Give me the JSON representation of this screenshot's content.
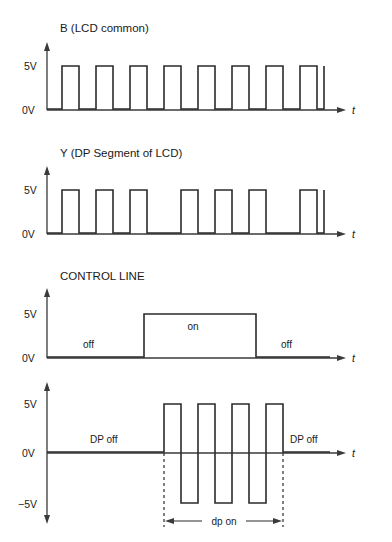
{
  "figure": {
    "kind": "timing-diagram",
    "background_color": "#ffffff",
    "line_color": "#2b2b2b",
    "axis_color": "#3a3a3a"
  },
  "panels": [
    {
      "id": "b-lcd-common",
      "title": "B (LCD common)",
      "y_labels": {
        "high": "5V",
        "low": "0V"
      },
      "x_label": "t",
      "signal": {
        "type": "square-wave",
        "levels": [
          "0V",
          "5V"
        ],
        "pulse_count": 8,
        "description": "continuous symmetric square wave, eight full high pulses then a final rising edge"
      },
      "annotations": []
    },
    {
      "id": "y-dp-segment",
      "title": "Y (DP Segment of LCD)",
      "y_labels": {
        "high": "5V",
        "low": "0V"
      },
      "x_label": "t",
      "signal": {
        "type": "square-wave",
        "levels": [
          "0V",
          "5V"
        ],
        "pulse_count": 8,
        "description": "square wave in phase with B for first three pulses, then phase-inverted during the dp-on interval, returning in phase at the end"
      },
      "annotations": []
    },
    {
      "id": "control-line",
      "title": "CONTROL LINE",
      "y_labels": {
        "high": "5V",
        "low": "0V"
      },
      "x_label": "t",
      "signal": {
        "type": "single-pulse",
        "levels": [
          "0V",
          "5V"
        ],
        "pulse_count": 1,
        "description": "low, then one wide high pulse, then low again"
      },
      "annotations": [
        {
          "text": "off",
          "region": "left-low"
        },
        {
          "text": "on",
          "region": "center-high"
        },
        {
          "text": "off",
          "region": "right-low"
        }
      ]
    },
    {
      "id": "dp-drive-difference",
      "title": "",
      "y_labels": {
        "high": "5V",
        "zero": "0V",
        "low": "−5V"
      },
      "x_label": "t",
      "signal": {
        "type": "bipolar-square-wave",
        "levels": [
          "−5V",
          "0V",
          "5V"
        ],
        "positive_pulse_count": 4,
        "negative_pulse_count": 3,
        "description": "flat at 0V, then alternating +5V and −5V pulses during dp on, then flat at 0V again"
      },
      "annotations": [
        {
          "text": "DP off",
          "region": "left-zero"
        },
        {
          "text": "DP off",
          "region": "right-zero"
        },
        {
          "text": "dp on",
          "region": "dimension-bracket"
        }
      ]
    }
  ]
}
